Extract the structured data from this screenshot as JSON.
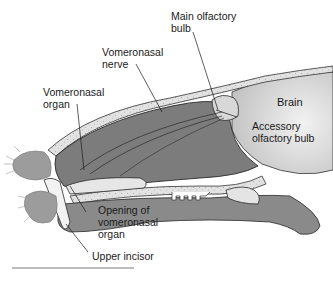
{
  "diagram": {
    "labels": {
      "main_olfactory_bulb": [
        "Main olfactory",
        "bulb"
      ],
      "vomeronasal_nerve": [
        "Vomeronasal",
        "nerve"
      ],
      "vomeronasal_organ": [
        "Vomeronasal",
        "organ"
      ],
      "brain": [
        "Brain"
      ],
      "accessory_olfactory_bulb": [
        "Accessory",
        "olfactory bulb"
      ],
      "opening_of_vomeronasal_organ": [
        "Opening of",
        "vomeronasal",
        "organ"
      ],
      "upper_incisor": [
        "Upper incisor"
      ]
    },
    "colors": {
      "tissue_dark": "#7a7a7a",
      "tissue_mid": "#9a9a9a",
      "bone_light": "#dcdcdc",
      "brain": "#d4d4d4",
      "outline": "#2a2a2a",
      "background": "#ffffff"
    }
  }
}
